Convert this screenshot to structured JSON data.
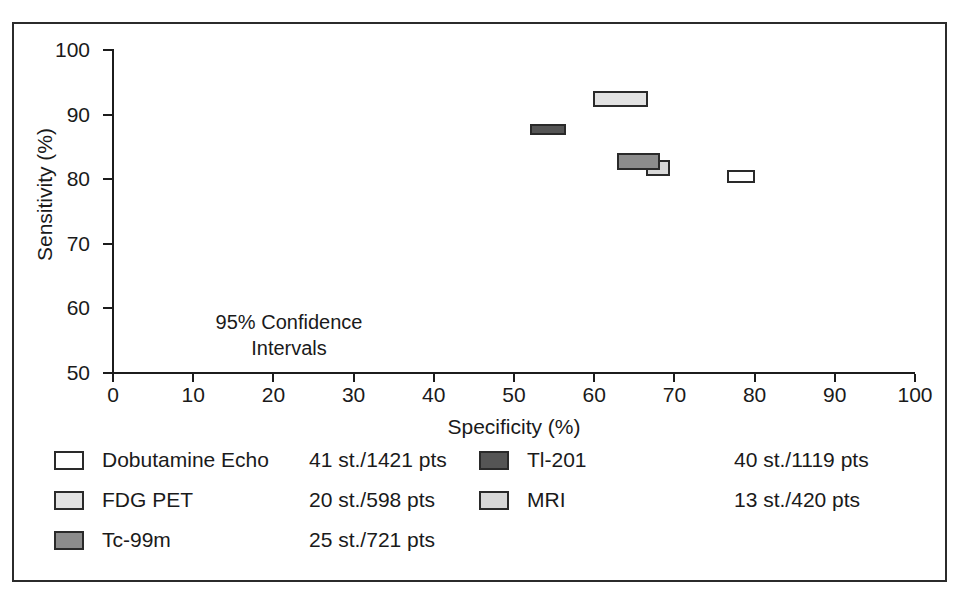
{
  "chart_data": {
    "type": "scatter",
    "title": "",
    "xlabel": "Specificity (%)",
    "ylabel": "Sensitivity (%)",
    "xlim": [
      0,
      100
    ],
    "ylim": [
      50,
      100
    ],
    "xticks": [
      0,
      10,
      20,
      30,
      40,
      50,
      60,
      70,
      80,
      90,
      100
    ],
    "yticks": [
      50,
      60,
      70,
      80,
      90,
      100
    ],
    "grid": false,
    "legend_position": "below-plot",
    "annotation": {
      "line1": "95% Confidence",
      "line2": "Intervals",
      "x": 30,
      "y": 62
    },
    "marker_style": "rectangle-confidence-region",
    "series": [
      {
        "name": "Dobutamine Echo",
        "color": "#ffffff",
        "studies": 41,
        "patients": 1421,
        "stats_label": "41 st./1421 pts",
        "specificity_ci": [
          76.6,
          80.0
        ],
        "sensitivity_ci": [
          79.4,
          81.4
        ],
        "specificity": 78.3,
        "sensitivity": 80.4
      },
      {
        "name": "FDG PET",
        "color": "#e2e2e2",
        "studies": 20,
        "patients": 598,
        "stats_label": "20 st./598 pts",
        "specificity_ci": [
          59.9,
          66.7
        ],
        "sensitivity_ci": [
          91.1,
          93.6
        ],
        "specificity": 63.3,
        "sensitivity": 92.4
      },
      {
        "name": "Tc-99m",
        "color": "#8c8c8c",
        "studies": 25,
        "patients": 721,
        "stats_label": "25 st./721 pts",
        "specificity_ci": [
          62.9,
          68.2
        ],
        "sensitivity_ci": [
          81.4,
          84.1
        ],
        "specificity": 65.5,
        "sensitivity": 82.8
      },
      {
        "name": "Tl-201",
        "color": "#555555",
        "studies": 40,
        "patients": 1119,
        "stats_label": "40 st./1119 pts",
        "specificity_ci": [
          52.0,
          56.5
        ],
        "sensitivity_ci": [
          86.9,
          88.5
        ],
        "specificity": 54.2,
        "sensitivity": 87.7
      },
      {
        "name": "MRI",
        "color": "#d8d8d8",
        "studies": 13,
        "patients": 420,
        "stats_label": "13 st./420 pts",
        "specificity_ci": [
          66.4,
          69.5
        ],
        "sensitivity_ci": [
          80.5,
          83.0
        ],
        "specificity": 68.0,
        "sensitivity": 81.8
      }
    ]
  },
  "axes": {
    "y_title": "Sensitivity (%)",
    "x_title": "Specificity (%)",
    "y_ticks": [
      "100",
      "90",
      "80",
      "70",
      "60",
      "50"
    ],
    "x_ticks": [
      "0",
      "10",
      "20",
      "30",
      "40",
      "50",
      "60",
      "70",
      "80",
      "90",
      "100"
    ]
  },
  "annotation": {
    "line1": "95% Confidence",
    "line2": "Intervals"
  },
  "legend": {
    "left_column": [
      {
        "label": "Dobutamine Echo",
        "stats": "41 st./1421 pts",
        "color": "#ffffff"
      },
      {
        "label": "FDG PET",
        "stats": "20 st./598 pts",
        "color": "#e2e2e2"
      },
      {
        "label": "Tc-99m",
        "stats": "25 st./721 pts",
        "color": "#8c8c8c"
      }
    ],
    "right_column": [
      {
        "label": "Tl-201",
        "stats": "40 st./1119 pts",
        "color": "#555555"
      },
      {
        "label": "MRI",
        "stats": "13 st./420 pts",
        "color": "#d8d8d8"
      }
    ]
  }
}
